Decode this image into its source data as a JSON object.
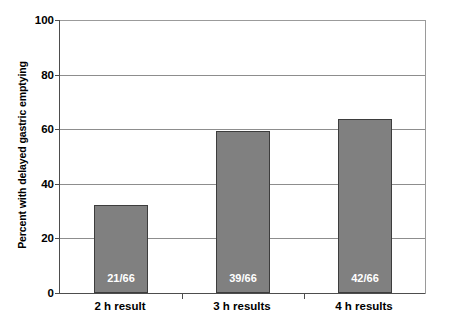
{
  "chart_data": {
    "type": "bar",
    "title": "",
    "subtitle": "",
    "xlabel": "",
    "ylabel": "Percent with delayed gastric emptying",
    "categories": [
      "2 h result",
      "3 h results",
      "4 h results"
    ],
    "values": [
      32.2,
      59.3,
      63.7
    ],
    "data_labels": [
      "21/66",
      "39/66",
      "42/66"
    ],
    "ylim": [
      0,
      100
    ],
    "ytick_labels": [
      "0",
      "20",
      "40",
      "60",
      "80",
      "100"
    ],
    "ytick_values": [
      0,
      20,
      40,
      60,
      80,
      100
    ],
    "grid": "horizontal",
    "legend": "none",
    "series": [
      {
        "name": "Percent with delayed gastric emptying",
        "values": [
          32.2,
          59.3,
          63.7
        ],
        "labels": [
          "21/66",
          "39/66",
          "42/66"
        ]
      }
    ],
    "colors": {
      "bar_fill": "#808080",
      "bar_border": "#3d3d3d",
      "gridline": "#8d8d8d",
      "axis": "#4d4d4d",
      "data_label_text": "#ffffff",
      "background": "#ffffff"
    }
  }
}
